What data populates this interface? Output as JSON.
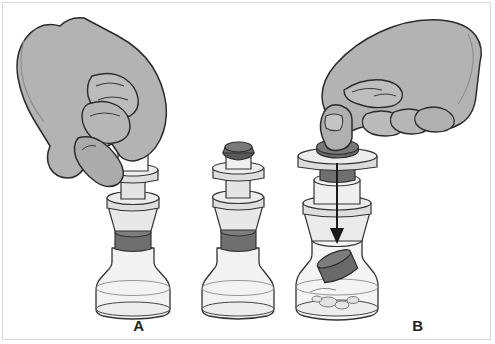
{
  "figure": {
    "background_color": "#ffffff",
    "border_color": "#d8d8d8",
    "width": 495,
    "height": 344
  },
  "palette": {
    "hand_fill": "#b3b3b3",
    "hand_outline": "#2b2b2b",
    "hand_shadow": "#9d9d9d",
    "device_light": "#e8e8e8",
    "device_mid": "#d0d0d0",
    "device_glass": "#f2f2f2",
    "stopper_dark": "#6f6f6f",
    "stopper_dark_shade": "#5a5a5a",
    "outline": "#333333",
    "granule_fill": "#e0e0e0",
    "arrow_color": "#1a1a1a",
    "caption_color": "#231f20"
  },
  "panels": [
    {
      "id": "a",
      "caption": "A",
      "hand": "left-hand-gripping",
      "hand_side": "left",
      "plunger_state": "up",
      "plunger_cap_visible": false,
      "arrow": false,
      "stopper_in_vial": false,
      "vial_contents": "empty",
      "description": "Left hand grips the transfer device barrel above the vial"
    },
    {
      "id": "b",
      "caption": "B",
      "hand": null,
      "hand_side": null,
      "plunger_state": "up",
      "plunger_cap_visible": true,
      "arrow": false,
      "stopper_in_vial": false,
      "vial_contents": "empty",
      "description": "Assembled device seated on the vial, plunger raised"
    },
    {
      "id": "c",
      "caption": "C",
      "hand": "right-hand-pressing",
      "hand_side": "right",
      "plunger_state": "down",
      "plunger_cap_visible": true,
      "arrow": true,
      "arrow_direction": "down",
      "stopper_in_vial": true,
      "vial_contents": "granules",
      "description": "Right thumb presses plunger fully down; stopper drops into vial with powder"
    }
  ],
  "captions": {
    "a": "A",
    "b": "B",
    "c": "C"
  }
}
